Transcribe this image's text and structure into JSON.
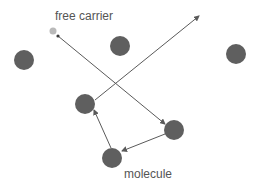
{
  "diagram": {
    "title": "",
    "labels": {
      "free_carrier": "free carrier",
      "molecule": "molecule"
    },
    "colors": {
      "background": "#ffffff",
      "molecule": "#5f5f5f",
      "free_carrier": "#b9b9b9",
      "arrow": "#5a5a5a",
      "text": "#555555"
    },
    "free_carrier": {
      "cx": 53,
      "cy": 31,
      "r": 3.5
    },
    "molecules": [
      {
        "id": "m1",
        "cx": 24,
        "cy": 60,
        "r": 10
      },
      {
        "id": "m2",
        "cx": 120,
        "cy": 46,
        "r": 10
      },
      {
        "id": "m3",
        "cx": 236,
        "cy": 54,
        "r": 10
      },
      {
        "id": "m4",
        "cx": 85,
        "cy": 104,
        "r": 10
      },
      {
        "id": "m5",
        "cx": 174,
        "cy": 130,
        "r": 10
      },
      {
        "id": "m6",
        "cx": 112,
        "cy": 158,
        "r": 10
      }
    ],
    "path_segments": [
      {
        "from": [
          58,
          36
        ],
        "to": [
          165,
          124
        ],
        "note": "free carrier to molecule m5"
      },
      {
        "from": [
          165,
          134
        ],
        "to": [
          122,
          151
        ],
        "note": "m5 to m6"
      },
      {
        "from": [
          111,
          148
        ],
        "to": [
          94,
          110
        ],
        "note": "m6 to m4"
      },
      {
        "from": [
          95,
          100
        ],
        "to": [
          199,
          16
        ],
        "note": "m4 escaping"
      }
    ]
  }
}
